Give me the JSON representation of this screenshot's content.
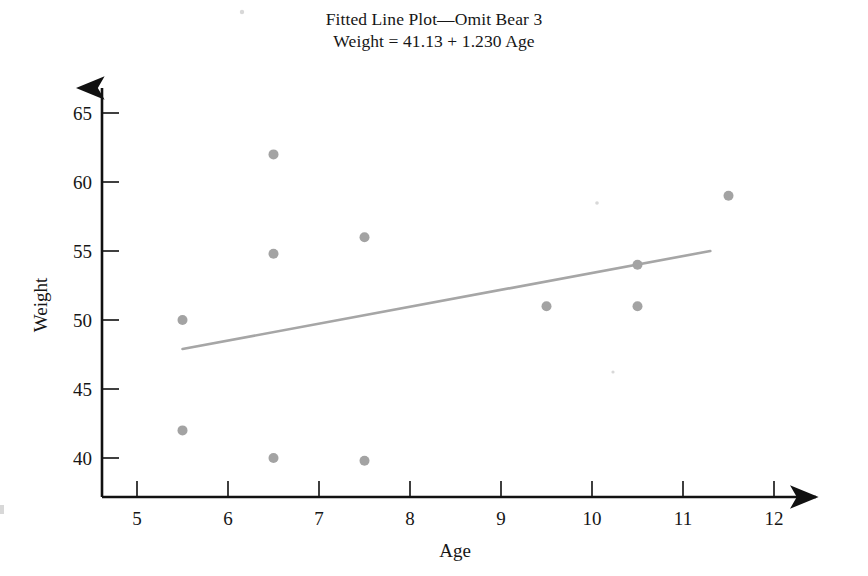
{
  "figure": {
    "title_line_1": "Fitted Line Plot—Omit Bear 3",
    "title_line_2": "Weight = 41.13 + 1.230 Age",
    "marker_color": "#a3a3a3",
    "line_color": "#a6a6a6",
    "axis_color": "#111111"
  },
  "chart_data": {
    "type": "scatter",
    "title": "Fitted Line Plot—Omit Bear 3",
    "subtitle": "Weight = 41.13 + 1.230 Age",
    "xlabel": "Age",
    "ylabel": "Weight",
    "xlim": [
      4.6,
      12.4
    ],
    "ylim": [
      37.5,
      66.5
    ],
    "xticks": [
      5,
      6,
      7,
      8,
      9,
      10,
      11,
      12
    ],
    "yticks": [
      40,
      45,
      50,
      55,
      60,
      65
    ],
    "xtick_labels": [
      "5",
      "6",
      "7",
      "8",
      "9",
      "10",
      "11",
      "12"
    ],
    "ytick_labels": [
      "40",
      "45",
      "50",
      "55",
      "60",
      "65"
    ],
    "grid": false,
    "legend": false,
    "points": [
      {
        "x": 5.5,
        "y": 50.0
      },
      {
        "x": 5.5,
        "y": 42.0
      },
      {
        "x": 6.5,
        "y": 62.0
      },
      {
        "x": 6.5,
        "y": 54.8
      },
      {
        "x": 6.5,
        "y": 40.0
      },
      {
        "x": 7.5,
        "y": 56.0
      },
      {
        "x": 7.5,
        "y": 39.8
      },
      {
        "x": 9.5,
        "y": 51.0
      },
      {
        "x": 10.5,
        "y": 54.0
      },
      {
        "x": 10.5,
        "y": 51.0
      },
      {
        "x": 11.5,
        "y": 59.0
      }
    ],
    "fit_line": {
      "equation": "Weight = 41.13 + 1.230 Age",
      "intercept": 41.13,
      "slope": 1.23,
      "x_start": 5.5,
      "x_end": 11.3,
      "y_start": 47.9,
      "y_end": 55.0
    }
  }
}
